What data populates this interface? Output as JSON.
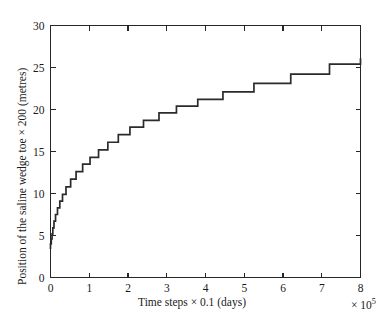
{
  "figure": {
    "background": "#ffffff",
    "ink_color": "#262626",
    "line_color": "#2b2b2b"
  },
  "axes": {
    "x_label": "Time steps × 0.1 (days)",
    "x_multiplier_prefix": "× 10",
    "x_multiplier_exponent": "5",
    "y_label": "Position of the saline wedge toe × 200 (metres)",
    "x_ticks": [
      "0",
      "1",
      "2",
      "3",
      "4",
      "5",
      "6",
      "7",
      "8"
    ],
    "y_ticks": [
      "0",
      "5",
      "10",
      "15",
      "20",
      "25",
      "30"
    ]
  },
  "chart_data": {
    "type": "line",
    "title": "",
    "xlabel": "Time steps × 0.1 (days)",
    "ylabel": "Position of the saline wedge toe × 200 (metres)",
    "xlim": [
      0,
      8
    ],
    "ylim": [
      0,
      30
    ],
    "x_scale_multiplier": "×10^5",
    "grid": false,
    "legend": null,
    "drawstyle": "steps-post",
    "x": [
      0.0,
      0.02,
      0.02,
      0.04,
      0.04,
      0.06,
      0.06,
      0.09,
      0.09,
      0.13,
      0.13,
      0.18,
      0.18,
      0.24,
      0.24,
      0.31,
      0.31,
      0.4,
      0.4,
      0.52,
      0.52,
      0.66,
      0.66,
      0.83,
      0.83,
      1.02,
      1.02,
      1.24,
      1.24,
      1.48,
      1.48,
      1.75,
      1.75,
      2.05,
      2.05,
      2.4,
      2.4,
      2.8,
      2.8,
      3.25,
      3.25,
      3.8,
      3.8,
      4.45,
      4.45,
      5.25,
      5.25,
      6.2,
      6.2,
      7.2,
      7.2,
      8.0
    ],
    "y": [
      4.0,
      4.0,
      4.6,
      4.6,
      5.2,
      5.2,
      5.9,
      5.9,
      6.7,
      6.7,
      7.5,
      7.5,
      8.3,
      8.3,
      9.1,
      9.1,
      9.9,
      9.9,
      10.8,
      10.8,
      11.7,
      11.7,
      12.6,
      12.6,
      13.5,
      13.5,
      14.3,
      14.3,
      15.2,
      15.2,
      16.1,
      16.1,
      17.0,
      17.0,
      17.9,
      17.9,
      18.7,
      18.7,
      19.6,
      19.6,
      20.4,
      20.4,
      21.2,
      21.2,
      22.1,
      22.1,
      23.1,
      23.1,
      24.2,
      24.2,
      25.4,
      25.4
    ],
    "final_plateau_value": 26.1,
    "initial_value": 4.0
  }
}
